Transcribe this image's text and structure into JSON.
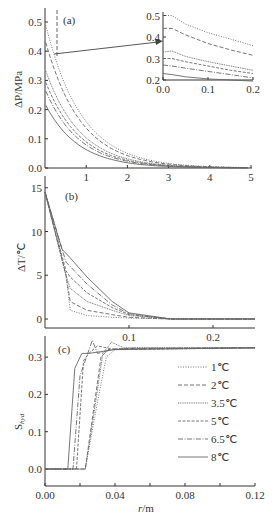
{
  "chart_data": [
    {
      "id": "a",
      "type": "line",
      "panel_label": "(a)",
      "xlabel": "",
      "ylabel": "ΔP/MPa",
      "xlim": [
        0,
        5
      ],
      "ylim": [
        0,
        0.55
      ],
      "xticks": [
        "1",
        "2",
        "3",
        "4",
        "5"
      ],
      "yticks": [
        "0.0",
        "0.1",
        "0.2",
        "0.3",
        "0.4",
        "0.5"
      ],
      "series_start_values": [
        0.5,
        0.44,
        0.34,
        0.3,
        0.27,
        0.22
      ],
      "decay_to_zero_near_x": 3.5,
      "inset": {
        "xlim": [
          0,
          0.2
        ],
        "ylim": [
          0.2,
          0.53
        ],
        "xticks": [
          "0.0",
          "0.1",
          "0.2"
        ],
        "yticks": [
          "0.2",
          "0.3",
          "0.4",
          "0.5"
        ],
        "series": [
          {
            "name": "1℃",
            "x": [
              0,
              0.02,
              0.05,
              0.1,
              0.15,
              0.2
            ],
            "values": [
              0.5,
              0.5,
              0.46,
              0.42,
              0.39,
              0.36
            ]
          },
          {
            "name": "2℃",
            "x": [
              0,
              0.02,
              0.05,
              0.1,
              0.15,
              0.2
            ],
            "values": [
              0.44,
              0.44,
              0.41,
              0.37,
              0.34,
              0.315
            ]
          },
          {
            "name": "3.5℃",
            "x": [
              0,
              0.02,
              0.05,
              0.1,
              0.15,
              0.2
            ],
            "values": [
              0.33,
              0.335,
              0.31,
              0.285,
              0.265,
              0.245
            ]
          },
          {
            "name": "5℃",
            "x": [
              0,
              0.02,
              0.05,
              0.1,
              0.15,
              0.2
            ],
            "values": [
              0.3,
              0.3,
              0.285,
              0.265,
              0.245,
              0.23
            ]
          },
          {
            "name": "6.5℃",
            "x": [
              0,
              0.02,
              0.05,
              0.1,
              0.15,
              0.2
            ],
            "values": [
              0.27,
              0.265,
              0.255,
              0.24,
              0.225,
              0.21
            ]
          },
          {
            "name": "8℃",
            "x": [
              0,
              0.02,
              0.05,
              0.1,
              0.15,
              0.2
            ],
            "values": [
              0.23,
              0.225,
              0.215,
              0.205,
              0.2,
              0.195
            ]
          }
        ]
      }
    },
    {
      "id": "b",
      "type": "line",
      "panel_label": "(b)",
      "xlabel": "",
      "ylabel": "ΔT/℃",
      "xlim": [
        0,
        0.25
      ],
      "ylim": [
        -1,
        16
      ],
      "xticks": [
        "0.1",
        "0.2"
      ],
      "yticks": [
        "0",
        "5",
        "10",
        "15"
      ],
      "series": [
        {
          "name": "1℃",
          "x": [
            0,
            0.025,
            0.03,
            0.05,
            0.08,
            0.1,
            0.15,
            0.25
          ],
          "values": [
            14.5,
            5,
            1,
            0.4,
            0.2,
            0.1,
            0,
            0
          ]
        },
        {
          "name": "2℃",
          "x": [
            0,
            0.025,
            0.03,
            0.05,
            0.08,
            0.1,
            0.15,
            0.25
          ],
          "values": [
            14.5,
            5,
            2,
            1,
            0.5,
            0.2,
            0,
            0
          ]
        },
        {
          "name": "3.5℃",
          "x": [
            0,
            0.025,
            0.03,
            0.05,
            0.08,
            0.1,
            0.15,
            0.25
          ],
          "values": [
            14.5,
            5,
            3.5,
            2,
            1,
            0.4,
            0,
            0
          ]
        },
        {
          "name": "5℃",
          "x": [
            0,
            0.025,
            0.03,
            0.05,
            0.08,
            0.1,
            0.15,
            0.25
          ],
          "values": [
            14.5,
            5.5,
            4.8,
            3,
            1.3,
            0.5,
            0,
            0
          ]
        },
        {
          "name": "6.5℃",
          "x": [
            0,
            0.025,
            0.03,
            0.05,
            0.08,
            0.1,
            0.15,
            0.25
          ],
          "values": [
            14.5,
            6.5,
            6,
            4,
            1.6,
            0.6,
            0,
            0
          ]
        },
        {
          "name": "8℃",
          "x": [
            0,
            0.02,
            0.03,
            0.05,
            0.08,
            0.1,
            0.15,
            0.25
          ],
          "values": [
            14.5,
            8,
            7,
            4.8,
            2,
            0.7,
            0,
            0
          ]
        }
      ]
    },
    {
      "id": "c",
      "type": "line",
      "panel_label": "(c)",
      "xlabel": "r/m",
      "ylabel": "Shyd",
      "xlim": [
        0,
        0.12
      ],
      "ylim": [
        -0.05,
        0.36
      ],
      "xticks": [
        "0.00",
        "0.04",
        "0.08",
        "0.12"
      ],
      "yticks": [
        "0.0",
        "0.1",
        "0.2",
        "0.3"
      ],
      "legend_position": "right",
      "series": [
        {
          "name": "1℃",
          "x": [
            0,
            0.023,
            0.03,
            0.035,
            0.04,
            0.05,
            0.12
          ],
          "values": [
            0,
            0,
            0.18,
            0.3,
            0.32,
            0.325,
            0.325
          ]
        },
        {
          "name": "2℃",
          "x": [
            0,
            0.023,
            0.026,
            0.032,
            0.036,
            0.045,
            0.12
          ],
          "values": [
            0,
            0,
            0.1,
            0.3,
            0.32,
            0.323,
            0.325
          ]
        },
        {
          "name": "3.5℃",
          "x": [
            0,
            0.023,
            0.028,
            0.033,
            0.038,
            0.045,
            0.12
          ],
          "values": [
            0,
            0,
            0.15,
            0.31,
            0.34,
            0.325,
            0.325
          ]
        },
        {
          "name": "5℃",
          "x": [
            0,
            0.018,
            0.022,
            0.025,
            0.03,
            0.04,
            0.12
          ],
          "values": [
            0,
            0,
            0.29,
            0.31,
            0.33,
            0.32,
            0.325
          ]
        },
        {
          "name": "6.5℃",
          "x": [
            0,
            0.016,
            0.02,
            0.027,
            0.03,
            0.04,
            0.12
          ],
          "values": [
            0,
            0,
            0.25,
            0.345,
            0.31,
            0.322,
            0.325
          ]
        },
        {
          "name": "8℃",
          "x": [
            0,
            0.013,
            0.017,
            0.021,
            0.025,
            0.04,
            0.12
          ],
          "values": [
            0,
            0,
            0.27,
            0.31,
            0.31,
            0.32,
            0.325
          ]
        }
      ]
    }
  ],
  "legend": [
    {
      "label": "1℃",
      "dash": "1,1.5"
    },
    {
      "label": "2℃",
      "dash": "4,2"
    },
    {
      "label": "3.5℃",
      "dash": "1,0.8"
    },
    {
      "label": "5℃",
      "dash": "3,1.5"
    },
    {
      "label": "6.5℃",
      "dash": "5,1.5,1,1.5"
    },
    {
      "label": "8℃",
      "dash": ""
    }
  ],
  "colors": {
    "axis": "#333333",
    "curve": "#666666",
    "background": "#ffffff"
  }
}
